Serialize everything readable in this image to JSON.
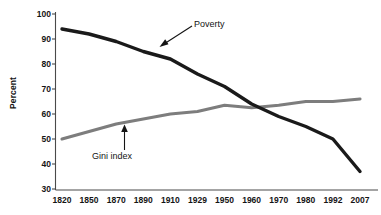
{
  "chart_data": {
    "type": "line",
    "title": "",
    "xlabel": "",
    "ylabel": "Percent",
    "ylim": [
      30,
      100
    ],
    "yticks": [
      30,
      40,
      50,
      60,
      70,
      80,
      90,
      100
    ],
    "grid": false,
    "legend": "none",
    "annotations": [
      {
        "text": "Poverty",
        "target_series": "Poverty",
        "arrow": "down-left"
      },
      {
        "text": "Gini index",
        "target_series": "Gini index",
        "arrow": "up"
      }
    ],
    "categories": [
      "1820",
      "1850",
      "1870",
      "1890",
      "1910",
      "1929",
      "1950",
      "1960",
      "1970",
      "1980",
      "1992",
      "2007"
    ],
    "series": [
      {
        "name": "Poverty",
        "color": "#1a1a1a",
        "values": [
          94,
          92,
          89,
          85,
          82,
          76,
          71,
          64,
          59,
          55,
          50,
          37
        ]
      },
      {
        "name": "Gini index",
        "color": "#7d7d7d",
        "values": [
          50,
          53,
          56,
          58,
          60,
          61,
          63.5,
          62.5,
          63.5,
          65,
          65,
          66
        ]
      }
    ]
  },
  "axis": {
    "y_title": "Percent"
  },
  "annotations": {
    "poverty_label": "Poverty",
    "gini_label": "Gini index"
  },
  "colors": {
    "poverty_line": "#1a1a1a",
    "gini_line": "#7d7d7d",
    "axis": "#4a4a4a",
    "text": "#141414",
    "background": "#ffffff"
  }
}
